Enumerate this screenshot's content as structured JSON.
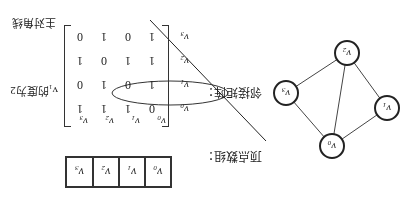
{
  "labels": {
    "main_diagonal": "主对角线",
    "degree_note": "v₁的度为2",
    "adjacency_matrix": "邻接矩阵：",
    "vertex_array": "顶点数组："
  },
  "vertices": [
    "v0",
    "v1",
    "v2",
    "v3"
  ],
  "vertex_display": [
    {
      "base": "v",
      "sub": "0"
    },
    {
      "base": "v",
      "sub": "1"
    },
    {
      "base": "v",
      "sub": "2"
    },
    {
      "base": "v",
      "sub": "3"
    }
  ],
  "matrix": [
    [
      0,
      1,
      1,
      1
    ],
    [
      1,
      0,
      1,
      0
    ],
    [
      1,
      1,
      0,
      1
    ],
    [
      1,
      0,
      1,
      0
    ]
  ],
  "highlighted_row": "v1",
  "graph": {
    "nodes": [
      {
        "id": "v0",
        "x": 82,
        "y": 62
      },
      {
        "id": "v1",
        "x": 27,
        "y": 100
      },
      {
        "id": "v2",
        "x": 67,
        "y": 155
      },
      {
        "id": "v3",
        "x": 128,
        "y": 115
      }
    ],
    "edges": [
      [
        "v0",
        "v1"
      ],
      [
        "v0",
        "v2"
      ],
      [
        "v0",
        "v3"
      ],
      [
        "v1",
        "v2"
      ],
      [
        "v2",
        "v3"
      ]
    ]
  },
  "orientation": "rotated 180 degrees"
}
